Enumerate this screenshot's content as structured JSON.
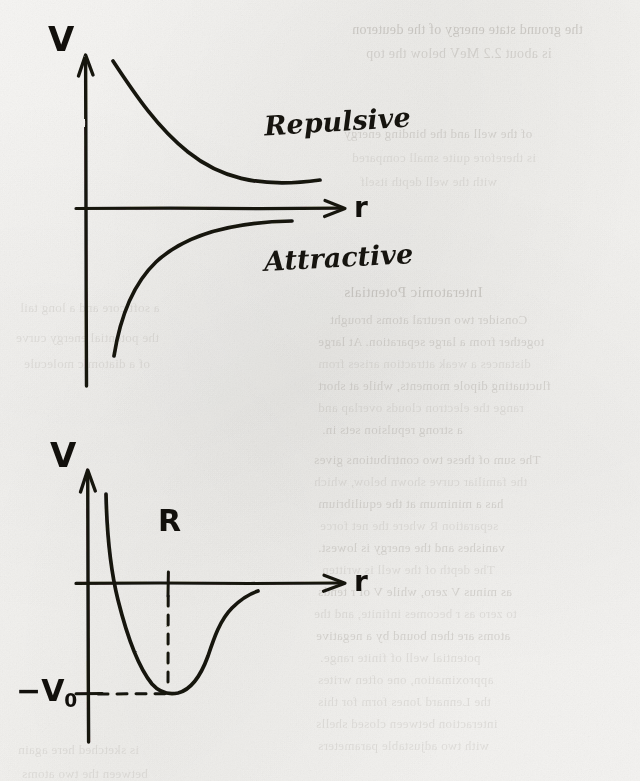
{
  "page": {
    "kind": "handwritten-physics-sketch",
    "paper_color": "#f7f6f4",
    "ink_color": "#16140f",
    "ghost_text_color": "#9a958e",
    "width": 640,
    "height": 781
  },
  "top_chart": {
    "name": "repulsive-and-attractive-potential",
    "y_axis_label": "V",
    "x_axis_label": "r",
    "curve_labels": {
      "repulsive": "Repulsive",
      "attractive": "Attractive"
    }
  },
  "bottom_chart": {
    "name": "net-interatomic-potential-well",
    "y_axis_label": "V",
    "x_axis_label": "r",
    "equilibrium_label": "R",
    "well_depth_sign": "−",
    "well_depth_symbol": "V",
    "well_depth_subscript": "0"
  },
  "ghost_text": {
    "note": "faint bleed-through from the reverse side of the sheet; illegible",
    "lines": [
      {
        "text": "the ground state energy of the deuteron",
        "x": 352,
        "y": 22,
        "size": 14,
        "weight": "strong"
      },
      {
        "text": "is about 2.2 MeV below the top",
        "x": 366,
        "y": 46,
        "size": 14,
        "weight": "normal"
      },
      {
        "text": "of the well and the binding energy",
        "x": 344,
        "y": 126,
        "size": 13,
        "weight": "normal"
      },
      {
        "text": "is therefore quite small compared",
        "x": 352,
        "y": 150,
        "size": 13,
        "weight": "weak"
      },
      {
        "text": "with the well depth itself",
        "x": 360,
        "y": 174,
        "size": 13,
        "weight": "weak"
      },
      {
        "text": "Interatomic Potentials",
        "x": 344,
        "y": 284,
        "size": 15,
        "weight": "strong"
      },
      {
        "text": "Consider two neutral atoms brought",
        "x": 330,
        "y": 312,
        "size": 13,
        "weight": "normal"
      },
      {
        "text": "together from a large separation. At large",
        "x": 318,
        "y": 334,
        "size": 13,
        "weight": "normal"
      },
      {
        "text": "distances a weak attraction arises from",
        "x": 318,
        "y": 356,
        "size": 13,
        "weight": "weak"
      },
      {
        "text": "fluctuating dipole moments, while at short",
        "x": 318,
        "y": 378,
        "size": 13,
        "weight": "normal"
      },
      {
        "text": "range the electron clouds overlap and",
        "x": 318,
        "y": 400,
        "size": 13,
        "weight": "weak"
      },
      {
        "text": "a strong repulsion sets in.",
        "x": 322,
        "y": 422,
        "size": 13,
        "weight": "normal"
      },
      {
        "text": "The sum of these two contributions gives",
        "x": 314,
        "y": 452,
        "size": 13,
        "weight": "normal"
      },
      {
        "text": "the familiar curve shown below, which",
        "x": 314,
        "y": 474,
        "size": 13,
        "weight": "weak"
      },
      {
        "text": "has a minimum at the equilibrium",
        "x": 318,
        "y": 496,
        "size": 13,
        "weight": "normal"
      },
      {
        "text": "separation R where the net force",
        "x": 320,
        "y": 518,
        "size": 13,
        "weight": "weak"
      },
      {
        "text": "vanishes and the energy is lowest.",
        "x": 318,
        "y": 540,
        "size": 13,
        "weight": "normal"
      },
      {
        "text": "The depth of the well is written",
        "x": 322,
        "y": 562,
        "size": 13,
        "weight": "weak"
      },
      {
        "text": "as minus V zero, while V of r tends",
        "x": 318,
        "y": 584,
        "size": 13,
        "weight": "normal"
      },
      {
        "text": "to zero as r becomes infinite, and the",
        "x": 314,
        "y": 606,
        "size": 13,
        "weight": "weak"
      },
      {
        "text": "atoms are then bound by a negative",
        "x": 316,
        "y": 628,
        "size": 13,
        "weight": "normal"
      },
      {
        "text": "potential well of finite range.",
        "x": 320,
        "y": 650,
        "size": 13,
        "weight": "weak"
      },
      {
        "text": "approximation, one often writes",
        "x": 318,
        "y": 672,
        "size": 13,
        "weight": "weak"
      },
      {
        "text": "the Lennard Jones form for this",
        "x": 318,
        "y": 694,
        "size": 13,
        "weight": "weak"
      },
      {
        "text": "interaction between closed shells",
        "x": 316,
        "y": 716,
        "size": 13,
        "weight": "weak"
      },
      {
        "text": "with two adjustable parameters",
        "x": 318,
        "y": 738,
        "size": 13,
        "weight": "weak"
      },
      {
        "text": "a soft core and a long tail",
        "x": 20,
        "y": 300,
        "size": 13,
        "weight": "weak"
      },
      {
        "text": "the potential energy curve",
        "x": 16,
        "y": 330,
        "size": 13,
        "weight": "weak"
      },
      {
        "text": "of a diatomic molecule",
        "x": 24,
        "y": 356,
        "size": 13,
        "weight": "weak"
      },
      {
        "text": "is sketched here again",
        "x": 18,
        "y": 742,
        "size": 13,
        "weight": "weak"
      },
      {
        "text": "between the two atoms",
        "x": 22,
        "y": 766,
        "size": 13,
        "weight": "weak"
      }
    ]
  },
  "chart_data": [
    {
      "type": "line",
      "name": "repulsive-attractive-components",
      "title": "",
      "xlabel": "r",
      "ylabel": "V",
      "grid": false,
      "legend": "inline-annotations",
      "annotations": [
        "Repulsive",
        "Attractive"
      ],
      "axis_origin": {
        "x": 0,
        "y": 0
      },
      "series": [
        {
          "name": "Repulsive",
          "comment": "positive, monotonically decaying ~ +A/r^n toward zero",
          "x": [
            0.3,
            0.45,
            0.65,
            0.9,
            1.2,
            1.55,
            1.95,
            2.4,
            2.9,
            3.4
          ],
          "y": [
            3.95,
            3.05,
            2.25,
            1.7,
            1.28,
            0.98,
            0.76,
            0.6,
            0.5,
            0.44
          ]
        },
        {
          "name": "Attractive",
          "comment": "negative, rising asymptotically toward zero ~ -B/r^m",
          "x": [
            0.32,
            0.45,
            0.62,
            0.85,
            1.15,
            1.5,
            1.9,
            2.35,
            2.8,
            3.1
          ],
          "y": [
            -3.3,
            -2.45,
            -1.8,
            -1.28,
            -0.88,
            -0.6,
            -0.42,
            -0.28,
            -0.2,
            -0.16
          ]
        }
      ]
    },
    {
      "type": "line",
      "name": "net-potential-well",
      "title": "",
      "xlabel": "r",
      "ylabel": "V",
      "grid": false,
      "annotations": [
        "R",
        "-V0"
      ],
      "markers": [
        {
          "label": "R",
          "kind": "x-tick-dashed",
          "x": 1.0,
          "y": -1.0
        },
        {
          "label": "-V0",
          "kind": "y-tick-dashed",
          "x": 1.0,
          "y": -1.0
        }
      ],
      "series": [
        {
          "name": "V(r)",
          "comment": "Lennard-Jones-like: steep repulsive wall, minimum -V0 at r = R, tail to 0",
          "x": [
            0.52,
            0.56,
            0.62,
            0.7,
            0.8,
            0.9,
            1.0,
            1.1,
            1.22,
            1.38,
            1.55,
            1.75,
            1.95,
            2.1
          ],
          "y": [
            3.05,
            2.1,
            1.05,
            0.1,
            -0.62,
            -0.92,
            -1.0,
            -0.95,
            -0.74,
            -0.46,
            -0.27,
            -0.16,
            -0.1,
            -0.08
          ]
        }
      ],
      "ylim": [
        -1.35,
        3.2
      ],
      "xlim": [
        0.0,
        2.6
      ]
    }
  ]
}
